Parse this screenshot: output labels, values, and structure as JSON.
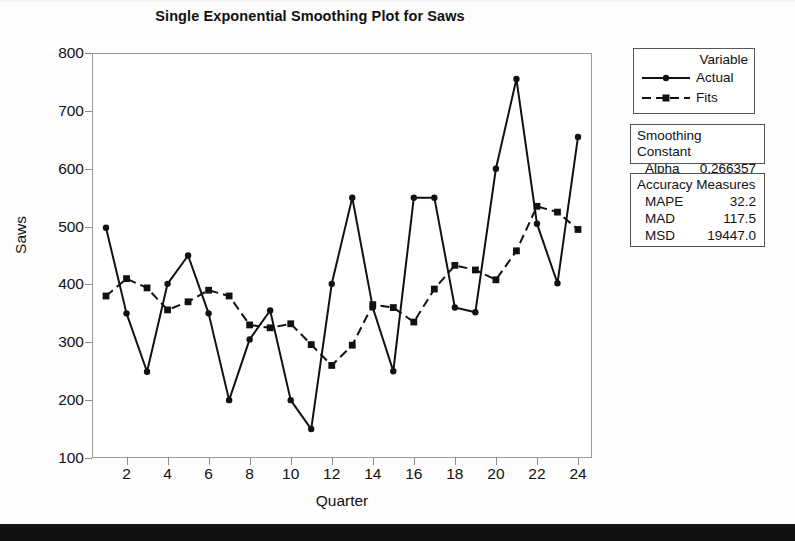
{
  "chart_data": {
    "type": "line",
    "title": "Single Exponential Smoothing Plot for Saws",
    "xlabel": "Quarter",
    "ylabel": "Saws",
    "x": [
      1,
      2,
      3,
      4,
      5,
      6,
      7,
      8,
      9,
      10,
      11,
      12,
      13,
      14,
      15,
      16,
      17,
      18,
      19,
      20,
      21,
      22,
      23,
      24
    ],
    "xlim": [
      1,
      24
    ],
    "ylim": [
      100,
      800
    ],
    "yticks": [
      100,
      200,
      300,
      400,
      500,
      600,
      700,
      800
    ],
    "xticks": [
      2,
      4,
      6,
      8,
      10,
      12,
      14,
      16,
      18,
      20,
      22,
      24
    ],
    "grid": false,
    "legend_position": "right",
    "series": [
      {
        "name": "Actual",
        "style": "solid",
        "marker": "circle",
        "values": [
          498,
          350,
          249,
          401,
          450,
          350,
          200,
          305,
          355,
          200,
          150,
          401,
          550,
          360,
          250,
          550,
          550,
          360,
          352,
          600,
          755,
          505,
          402,
          655
        ]
      },
      {
        "name": "Fits",
        "style": "dashed",
        "marker": "square",
        "values": [
          380,
          410,
          394,
          356,
          370,
          390,
          380,
          330,
          325,
          332,
          296,
          260,
          295,
          365,
          360,
          335,
          392,
          433,
          425,
          408,
          458,
          535,
          525,
          495
        ]
      }
    ]
  },
  "legend": {
    "title": "Variable",
    "entries": [
      {
        "label": "Actual"
      },
      {
        "label": "Fits"
      }
    ]
  },
  "smoothing_constant": {
    "title": "Smoothing Constant",
    "alpha_label": "Alpha",
    "alpha_value": "0.266357"
  },
  "accuracy_measures": {
    "title": "Accuracy Measures",
    "rows": [
      {
        "key": "MAPE",
        "value": "32.2"
      },
      {
        "key": "MAD",
        "value": "117.5"
      },
      {
        "key": "MSD",
        "value": "19447.0"
      }
    ]
  },
  "colors": {
    "series": "#111111",
    "frame": "#9a9a9a",
    "text": "#111111",
    "bottom_bar": "#111111"
  }
}
